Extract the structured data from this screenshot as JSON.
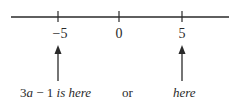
{
  "number_line": {
    "ticks": [
      {
        "label": "−5",
        "value": -5
      },
      {
        "label": "0",
        "value": 0
      },
      {
        "label": "5",
        "value": 5
      }
    ]
  },
  "annotations": {
    "left_prefix": "3",
    "left_var": "a",
    "left_mid": " − 1 ",
    "left_suffix": "is here",
    "connector": "or",
    "right": "here"
  },
  "colors": {
    "ink": "#2a2a2a",
    "background": "#ffffff"
  }
}
